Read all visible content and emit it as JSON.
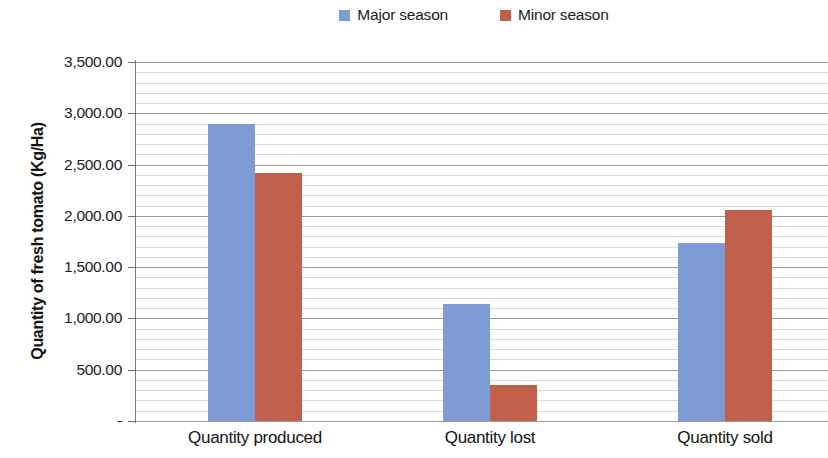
{
  "chart_data": {
    "type": "bar",
    "title": "",
    "xlabel": "",
    "ylabel": "Quantity of fresh tomato (Kg/Ha)",
    "categories": [
      "Quantity produced",
      "Quantity lost",
      "Quantity sold"
    ],
    "series": [
      {
        "name": "Major season",
        "color": "#7E9BD5",
        "values": [
          2895,
          1140,
          1740
        ]
      },
      {
        "name": "Minor season",
        "color": "#C1604A",
        "values": [
          2420,
          350,
          2055
        ]
      }
    ],
    "ylim": [
      0,
      3500
    ],
    "ytick_values": [
      0,
      500,
      1000,
      1500,
      2000,
      2500,
      3000,
      3500
    ],
    "ytick_labels": [
      "-",
      "500.00",
      "1,000.00",
      "1,500.00",
      "2,000.00",
      "2,500.00",
      "3,000.00",
      "3,500.00"
    ],
    "y_major_step": 500,
    "y_minor_step": 100,
    "grid": "horizontal",
    "legend_position": "top-center",
    "legend": [
      {
        "label": "Major season",
        "color": "#7E9BD5"
      },
      {
        "label": "Minor season",
        "color": "#C1604A"
      }
    ]
  },
  "axis": {
    "y_title": "Quantity of fresh tomato (Kg/Ha)"
  },
  "colors": {
    "major_season": "#7E9BD5",
    "minor_season": "#C1604A",
    "gridline_major": "#9A9A9A",
    "gridline_minor": "#D9D9D9",
    "axis_line": "#7A7A7A",
    "background": "#FFFFFF",
    "text": "#1C1C1C"
  }
}
